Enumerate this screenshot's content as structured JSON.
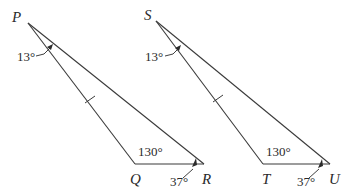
{
  "figure": {
    "type": "congruent-triangles",
    "triangles": [
      {
        "name": "triangle-PQR",
        "vertices": {
          "P": "P",
          "Q": "Q",
          "R": "R"
        },
        "angles": {
          "at_P": "13°",
          "at_Q": "130°",
          "at_R": "37°"
        },
        "congruent_side": "PQ"
      },
      {
        "name": "triangle-STU",
        "vertices": {
          "S": "S",
          "T": "T",
          "U": "U"
        },
        "angles": {
          "at_S": "13°",
          "at_T": "130°",
          "at_U": "37°"
        },
        "congruent_side": "ST"
      }
    ]
  },
  "labels": {
    "P": "P",
    "Q": "Q",
    "R": "R",
    "S": "S",
    "T": "T",
    "U": "U",
    "angle_P": "13°",
    "angle_Q": "130°",
    "angle_R": "37°",
    "angle_S": "13°",
    "angle_T": "130°",
    "angle_U": "37°"
  },
  "colors": {
    "stroke": "#3a3a3a",
    "text": "#2a2a2a",
    "background": "#ffffff"
  }
}
